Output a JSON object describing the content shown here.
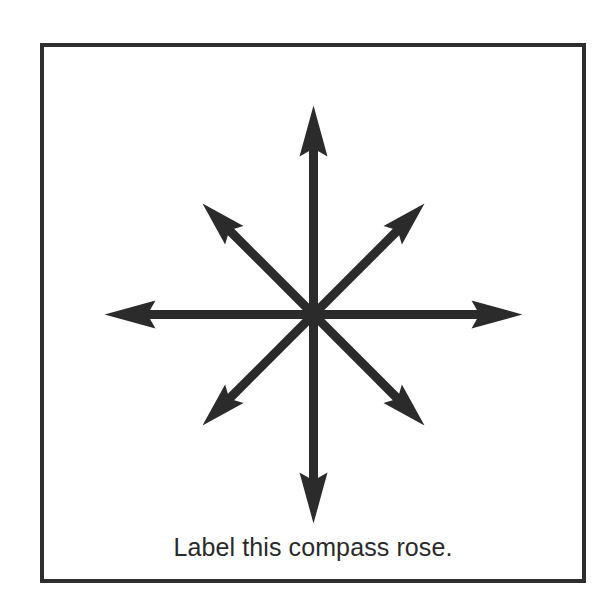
{
  "worksheet": {
    "caption": "Label this compass rose.",
    "colors": {
      "ink": "#2b2b2b",
      "border": "#2e2e2e",
      "background": "#ffffff"
    },
    "compass_rose": {
      "center": [
        313,
        314
      ],
      "arrows": [
        {
          "direction": "north",
          "label": "",
          "tip": [
            313,
            105
          ]
        },
        {
          "direction": "northeast",
          "label": "",
          "tip": [
            423,
            202
          ]
        },
        {
          "direction": "east",
          "label": "",
          "tip": [
            522,
            314
          ]
        },
        {
          "direction": "southeast",
          "label": "",
          "tip": [
            424,
            427
          ]
        },
        {
          "direction": "south",
          "label": "",
          "tip": [
            313,
            522
          ]
        },
        {
          "direction": "southwest",
          "label": "",
          "tip": [
            204,
            427
          ]
        },
        {
          "direction": "west",
          "label": "",
          "tip": [
            104,
            316
          ]
        },
        {
          "direction": "northwest",
          "label": "",
          "tip": [
            203,
            202
          ]
        }
      ]
    }
  }
}
